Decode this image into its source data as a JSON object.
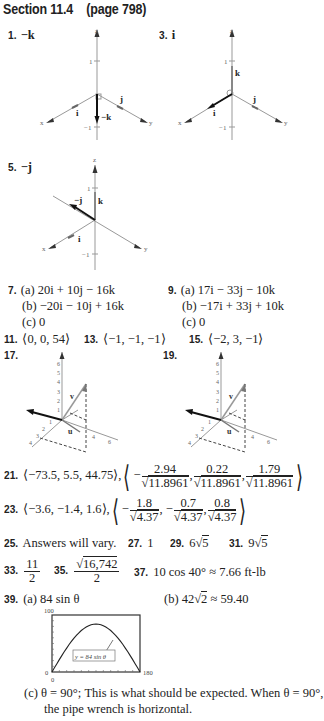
{
  "header": {
    "title": "Section 11.4",
    "page_ref": "(page 798)"
  },
  "figures": {
    "ex1": {
      "number": "1.",
      "answer": "−k",
      "labels": {
        "z": "z",
        "x": "x",
        "y": "y",
        "one": "1",
        "neg_one": "−1",
        "i": "i",
        "j": "j",
        "vec": "−k"
      }
    },
    "ex3": {
      "number": "3.",
      "answer": "i",
      "labels": {
        "z": "z",
        "x": "x",
        "y": "y",
        "one": "1",
        "neg_one": "−1",
        "i": "i",
        "j": "j",
        "k": "k"
      }
    },
    "ex5": {
      "number": "5.",
      "answer": "−j",
      "labels": {
        "z": "z",
        "x": "x",
        "y": "y",
        "one": "1",
        "neg_one": "−1",
        "i": "i",
        "k": "k",
        "vec": "−j"
      }
    },
    "ex17": {
      "number": "17.",
      "labels": {
        "v": "v",
        "u": "u",
        "z_ticks": [
          "1",
          "2",
          "3",
          "4",
          "5",
          "6"
        ],
        "x_ticks": [
          "1",
          "2",
          "3",
          "4"
        ],
        "y_ticks": [
          "4",
          "6"
        ]
      }
    },
    "ex19": {
      "number": "19.",
      "labels": {
        "v": "v",
        "u": "u",
        "z_ticks": [
          "1",
          "2",
          "3",
          "4",
          "5",
          "6"
        ],
        "x_ticks": [
          "1",
          "2",
          "3",
          "4"
        ],
        "y_ticks": [
          "4",
          "6"
        ]
      }
    }
  },
  "answers": {
    "a7": {
      "number": "7.",
      "a": "(a) 20i + 10j − 16k",
      "b": "(b) −20i − 10j + 16k",
      "c": "(c) 0"
    },
    "a9": {
      "number": "9.",
      "a": "(a) 17i − 33j − 10k",
      "b": "(b) −17i + 33j + 10k",
      "c": "(c) 0"
    },
    "a11": {
      "number": "11.",
      "text": "⟨0, 0, 54⟩"
    },
    "a13": {
      "number": "13.",
      "text": "⟨−1, −1, −1⟩"
    },
    "a15": {
      "number": "15.",
      "text": "⟨−2, 3, −1⟩"
    },
    "a21": {
      "number": "21.",
      "vec": "⟨−73.5, 5.5, 44.75⟩,",
      "n1": "2.94",
      "n2": "0.22",
      "n3": "1.79",
      "den": "11.8961"
    },
    "a23": {
      "number": "23.",
      "vec": "⟨−3.6, −1.4, 1.6⟩,",
      "n1": "1.8",
      "n2": "0.7",
      "n3": "0.8",
      "den": "4.37"
    },
    "a25": {
      "number": "25.",
      "text": "Answers will vary."
    },
    "a27": {
      "number": "27.",
      "text": "1"
    },
    "a29": {
      "number": "29.",
      "coef": "6",
      "rad": "5"
    },
    "a31": {
      "number": "31.",
      "coef": "9",
      "rad": "5"
    },
    "a33": {
      "number": "33.",
      "num": "11",
      "den": "2"
    },
    "a35": {
      "number": "35.",
      "rad": "16,742",
      "den": "2"
    },
    "a37": {
      "number": "37.",
      "text": "10 cos 40° ≈ 7.66 ft-lb"
    },
    "a39": {
      "number": "39.",
      "a": "(a) 84 sin θ",
      "b_pre": "(b) 42",
      "b_rad": "2",
      "b_post": "≈ 59.40",
      "c_line1": "(c) θ = 90°; This is what should be expected. When θ = 90°,",
      "c_line2": "the pipe wrench is horizontal."
    }
  },
  "chart_data": {
    "type": "line",
    "title": "",
    "series": [
      {
        "name": "y = 84 sin θ",
        "x": [
          0,
          15,
          30,
          45,
          60,
          75,
          90,
          105,
          120,
          135,
          150,
          165,
          180
        ],
        "values": [
          0,
          21.7,
          42,
          59.4,
          72.7,
          81.1,
          84,
          81.1,
          72.7,
          59.4,
          42,
          21.7,
          0
        ]
      }
    ],
    "xlabel": "",
    "ylabel": "",
    "xlim": [
      0,
      180
    ],
    "ylim": [
      0,
      100
    ],
    "tick_labels": {
      "x_min": "0",
      "x_max": "180",
      "y_min": "0",
      "y_max": "100"
    },
    "legend_label": "y = 84 sin θ",
    "grid": false
  }
}
